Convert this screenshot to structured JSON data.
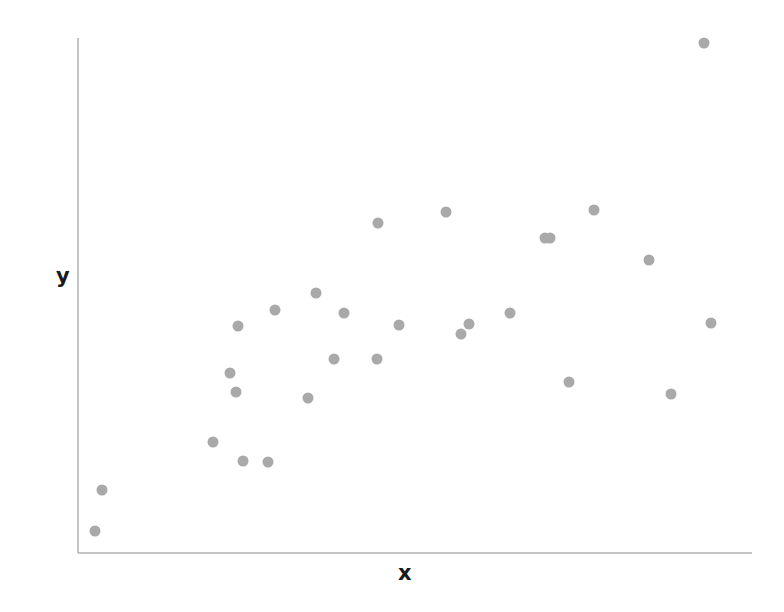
{
  "chart_data": {
    "type": "scatter",
    "title": "",
    "xlabel": "x",
    "ylabel": "y",
    "grid": false,
    "legend": null,
    "xlim": [
      0,
      1
    ],
    "ylim": [
      0,
      1
    ],
    "xticks": [],
    "yticks": [],
    "marker": {
      "color": "#a9a9a9",
      "size_px": 11,
      "shape": "circle",
      "opacity": 1
    },
    "axis": {
      "color": "#b0b0b0",
      "width_px": 1.5,
      "spines": [
        "left",
        "bottom"
      ],
      "origin_px": [
        78,
        553
      ],
      "x_end_px": 752,
      "y_top_px": 38
    },
    "n_points": 28,
    "points_px": [
      [
        95,
        531
      ],
      [
        102,
        490
      ],
      [
        213,
        442
      ],
      [
        238,
        326
      ],
      [
        230,
        373
      ],
      [
        236,
        392
      ],
      [
        243,
        461
      ],
      [
        268,
        462
      ],
      [
        275,
        310
      ],
      [
        308,
        398
      ],
      [
        316,
        293
      ],
      [
        334,
        359
      ],
      [
        344,
        313
      ],
      [
        377,
        359
      ],
      [
        378,
        223
      ],
      [
        399,
        325
      ],
      [
        446,
        212
      ],
      [
        461,
        334
      ],
      [
        469,
        324
      ],
      [
        510,
        313
      ],
      [
        545,
        238
      ],
      [
        550,
        238
      ],
      [
        569,
        382
      ],
      [
        594,
        210
      ],
      [
        649,
        260
      ],
      [
        671,
        394
      ],
      [
        704,
        43
      ],
      [
        711,
        323
      ]
    ],
    "x": [
      0.025,
      0.036,
      0.2,
      0.237,
      0.226,
      0.234,
      0.245,
      0.282,
      0.292,
      0.341,
      0.353,
      0.38,
      0.395,
      0.443,
      0.445,
      0.476,
      0.546,
      0.568,
      0.58,
      0.641,
      0.693,
      0.7,
      0.728,
      0.766,
      0.847,
      0.879,
      0.928,
      0.939
    ],
    "y": [
      0.043,
      0.122,
      0.216,
      0.441,
      0.35,
      0.313,
      0.179,
      0.177,
      0.472,
      0.301,
      0.505,
      0.377,
      0.466,
      0.377,
      0.641,
      0.443,
      0.662,
      0.425,
      0.445,
      0.466,
      0.612,
      0.612,
      0.332,
      0.666,
      0.569,
      0.309,
      0.991,
      0.446
    ]
  },
  "labels": {
    "x_axis": "x",
    "y_axis": "y"
  }
}
